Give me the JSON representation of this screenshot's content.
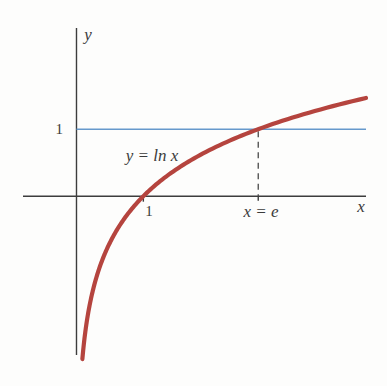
{
  "figure": {
    "type": "textbook-graph",
    "background": "#fdfdfc",
    "labels": {
      "y_axis": "y",
      "x_axis": "x",
      "y_tick_1": "1",
      "x_tick_1": "1",
      "curve_equation": "y = ln x",
      "x_equals_e": "x = e"
    },
    "colors": {
      "curve": "#b5443e",
      "hline": "#6699cc",
      "axis": "#3d3d3d",
      "dash": "#4a4a4a",
      "text": "#3b3b3b"
    }
  },
  "chart_data": {
    "type": "line",
    "xlabel": "x",
    "ylabel": "y",
    "xlim": [
      -0.8,
      4.33
    ],
    "ylim": [
      -2.37,
      2.51
    ],
    "grid": false,
    "legend": "none",
    "series": [
      {
        "name": "y = ln x",
        "fn": "ln",
        "x_domain": [
          0.088,
          4.33
        ],
        "color": "#b5443e",
        "style": "solid-thick"
      },
      {
        "name": "y = 1",
        "fn": "constant",
        "value": 1,
        "x_domain": [
          0,
          4.33
        ],
        "color": "#6699cc",
        "style": "solid-thin"
      }
    ],
    "x_ticks": [
      {
        "value": 1,
        "label": "1"
      },
      {
        "value": 2.71828,
        "label": "x = e"
      }
    ],
    "y_ticks": [
      {
        "value": 1,
        "label": "1"
      }
    ],
    "dashed_vline": {
      "x": 2.71828,
      "y_from": 0,
      "y_to": 1
    },
    "intersection_point": {
      "x": 2.71828,
      "y": 1
    },
    "annotations": [
      {
        "text": "y = ln x",
        "anchor_x": 1.12,
        "anchor_y": 0.55,
        "role": "curve-equation"
      },
      {
        "text": "x = e",
        "anchor_x": 2.71828,
        "anchor_y": -0.28,
        "role": "dashed-line-label"
      }
    ]
  }
}
